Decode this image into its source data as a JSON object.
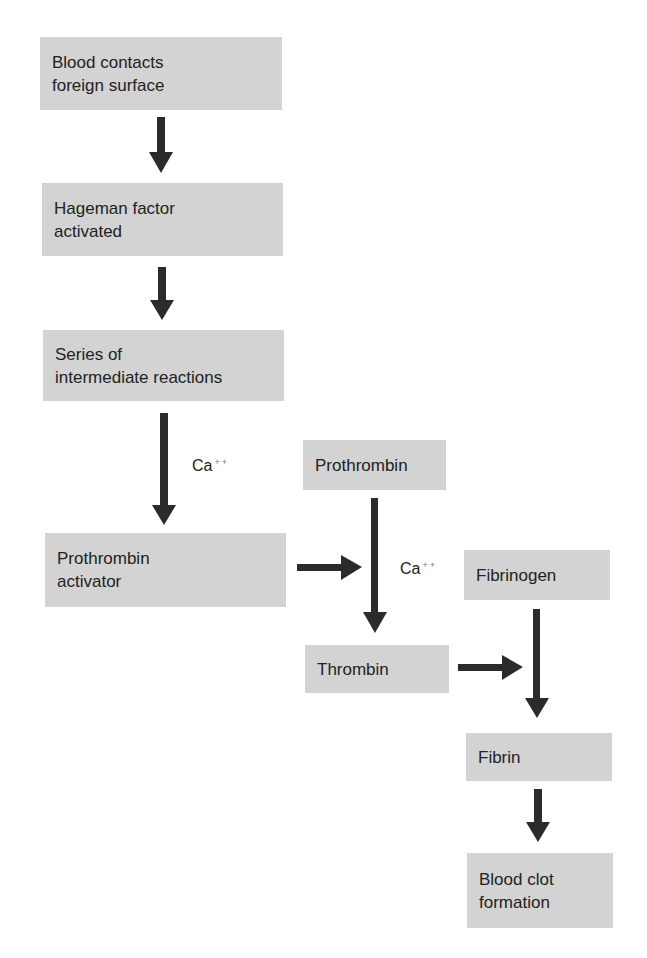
{
  "diagram": {
    "boxes": [
      {
        "id": "blood-contacts",
        "text": "Blood contacts\nforeign surface"
      },
      {
        "id": "hageman",
        "text": "Hageman factor\nactivated"
      },
      {
        "id": "intermediate",
        "text": "Series of\nintermediate reactions"
      },
      {
        "id": "prothrombin-activator",
        "text": "Prothrombin\nactivator"
      },
      {
        "id": "prothrombin",
        "text": "Prothrombin"
      },
      {
        "id": "thrombin",
        "text": "Thrombin"
      },
      {
        "id": "fibrinogen",
        "text": "Fibrinogen"
      },
      {
        "id": "fibrin",
        "text": "Fibrin"
      },
      {
        "id": "blood-clot",
        "text": "Blood clot\nformation"
      }
    ],
    "labels": [
      {
        "id": "ca-1",
        "base": "Ca",
        "sup": "++"
      },
      {
        "id": "ca-2",
        "base": "Ca",
        "sup": "++"
      }
    ],
    "colors": {
      "box": "#d3d3d3",
      "arrow": "#2b2b2b",
      "text": "#222222"
    }
  }
}
